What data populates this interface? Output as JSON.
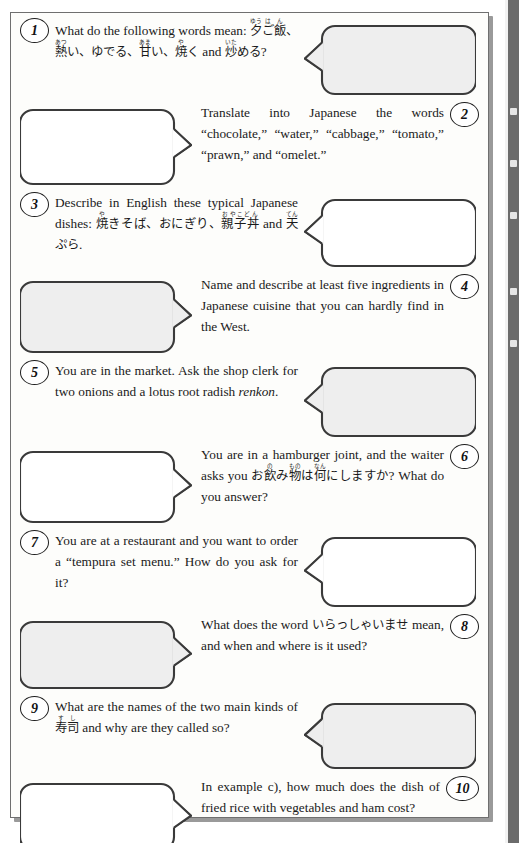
{
  "page": {
    "background_color": "#fdfdfb",
    "border_color": "#6f6f6f",
    "shadow_color": "#9a9a9a",
    "edge_band_color": "#6b6b6b",
    "bubble_fill": "#f2f2f2",
    "bubble_stroke": "#3a3a3a",
    "text_color": "#1a1a1a"
  },
  "exercises": [
    {
      "number": "1",
      "number_side": "left",
      "bubble_side": "right",
      "bubble_tail": "left",
      "bubble_fill": "#eeeeee",
      "text_html": "What do the following words mean: <span class=\"jp\"><ruby>夕<rt>ゆう</rt></ruby><ruby>ご飯<rt>はん</rt></ruby>、<ruby>熱<rt>あつ</rt></ruby>い、ゆでる、<ruby>甘<rt>あま</rt></ruby>い、<ruby>焼<rt>や</rt></ruby>く</span> and <span class=\"jp\"><ruby>炒<rt>いた</rt></ruby>める</span>?",
      "plain_text": "What do the following words mean: 夕ご飯、熱い、ゆでる、甘い、焼く and 炒める?"
    },
    {
      "number": "2",
      "number_side": "right",
      "bubble_side": "left",
      "bubble_tail": "right",
      "bubble_fill": "#ffffff",
      "text_html": "Translate into Japanese the words &ldquo;chocolate,&rdquo; &ldquo;water,&rdquo; &ldquo;cabbage,&rdquo; &ldquo;tomato,&rdquo; &ldquo;prawn,&rdquo; and &ldquo;omelet.&rdquo;",
      "plain_text": "Translate into Japanese the words \"chocolate,\" \"water,\" \"cabbage,\" \"tomato,\" \"prawn,\" and \"omelet.\""
    },
    {
      "number": "3",
      "number_side": "left",
      "bubble_side": "right",
      "bubble_tail": "left",
      "bubble_fill": "#ffffff",
      "text_html": "Describe in English these typical Japanese dishes: <span class=\"jp\"><ruby>焼<rt>や</rt></ruby>きそば、おにぎり、<ruby>親子丼<rt>おやこどん</rt></ruby></span> and <span class=\"jp\"><ruby>天<rt>てん</rt></ruby>ぷら</span>.",
      "plain_text": "Describe in English these typical Japanese dishes: 焼きそば、おにぎり、親子丼 and 天ぷら."
    },
    {
      "number": "4",
      "number_side": "right",
      "bubble_side": "left",
      "bubble_tail": "right",
      "bubble_fill": "#eeeeee",
      "text_html": "Name and describe at least five ingredients in Japanese cuisine that you can hardly find in the West.",
      "plain_text": "Name and describe at least five ingredients in Japanese cuisine that you can hardly find in the West."
    },
    {
      "number": "5",
      "number_side": "left",
      "bubble_side": "right",
      "bubble_tail": "left",
      "bubble_fill": "#eeeeee",
      "text_html": "You are in the market. Ask the shop clerk for two onions and a lotus root radish <i>renkon</i>.",
      "plain_text": "You are in the market. Ask the shop clerk for two onions and a lotus root radish renkon."
    },
    {
      "number": "6",
      "number_side": "right",
      "bubble_side": "left",
      "bubble_tail": "right",
      "bubble_fill": "#ffffff",
      "text_html": "You are in a hamburger joint, and the waiter asks you <span class=\"jp\">お<ruby>飲<rt>の</rt></ruby>み<ruby>物<rt>もの</rt></ruby>は<ruby>何<rt>なん</rt></ruby>にしますか</span>? What do you answer?",
      "plain_text": "You are in a hamburger joint, and the waiter asks you お飲み物は何にしますか? What do you answer?"
    },
    {
      "number": "7",
      "number_side": "left",
      "bubble_side": "right",
      "bubble_tail": "left",
      "bubble_fill": "#ffffff",
      "text_html": "You are at a restaurant and you want to order a &ldquo;tempura set menu.&rdquo; How do you ask for it?",
      "plain_text": "You are at a restaurant and you want to order a \"tempura set menu.\" How do you ask for it?"
    },
    {
      "number": "8",
      "number_side": "right",
      "bubble_side": "left",
      "bubble_tail": "right",
      "bubble_fill": "#eeeeee",
      "text_html": "What does the word <span class=\"jp\">いらっしゃいませ</span> mean, and when and where is it used?",
      "plain_text": "What does the word いらっしゃいませ mean, and when and where is it used?"
    },
    {
      "number": "9",
      "number_side": "left",
      "bubble_side": "right",
      "bubble_tail": "left",
      "bubble_fill": "#eeeeee",
      "text_html": "What are the names of the two main kinds of <span class=\"jp\"><ruby>寿司<rt>すし</rt></ruby></span> and why are they called so?",
      "plain_text": "What are the names of the two main kinds of 寿司 and why are they called so?"
    },
    {
      "number": "10",
      "number_side": "right",
      "bubble_side": "left",
      "bubble_tail": "right",
      "bubble_fill": "#ffffff",
      "text_html": "In example c), how much does the dish of fried rice with vegetables and ham cost?",
      "plain_text": "In example c), how much does the dish of fried rice with vegetables and ham cost?"
    }
  ]
}
